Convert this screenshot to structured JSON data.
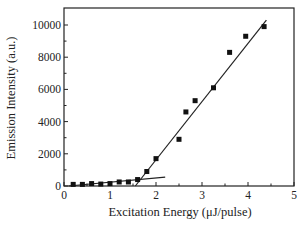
{
  "chart_data": {
    "type": "scatter",
    "title": "",
    "xlabel": "Excitation Energy (μJ/pulse)",
    "ylabel": "Emission Intensity (a.u.)",
    "xlim": [
      0,
      5
    ],
    "ylim": [
      0,
      11000
    ],
    "xticks": [
      0,
      1,
      2,
      3,
      4,
      5
    ],
    "yticks": [
      0,
      2000,
      4000,
      6000,
      8000,
      10000
    ],
    "grid": false,
    "legend": null,
    "series": [
      {
        "name": "measured",
        "marker": "square",
        "x": [
          0.2,
          0.4,
          0.6,
          0.8,
          1.0,
          1.2,
          1.4,
          1.6,
          1.8,
          2.0,
          2.5,
          2.65,
          2.85,
          3.25,
          3.6,
          3.95,
          4.35
        ],
        "y": [
          100,
          100,
          150,
          120,
          150,
          250,
          250,
          400,
          900,
          1700,
          2900,
          4600,
          5300,
          6100,
          8300,
          9300,
          9900
        ]
      }
    ],
    "fit_lines": [
      {
        "name": "below-threshold fit",
        "x": [
          0.1,
          2.2
        ],
        "y": [
          0,
          550
        ]
      },
      {
        "name": "above-threshold fit",
        "x": [
          1.55,
          4.4
        ],
        "y": [
          0,
          10300
        ]
      }
    ]
  }
}
